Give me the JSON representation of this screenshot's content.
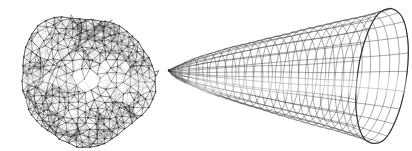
{
  "figure": {
    "background_color": "#ffffff",
    "canvas": {
      "width": 412,
      "height": 151
    },
    "left_mesh": {
      "label": "triangulated-blob-mesh",
      "cx": 86,
      "cy": 80,
      "rx": 64,
      "ry": 67,
      "rings": 9,
      "radial_exponent": 0.72,
      "cell_px": 8,
      "edge_max_px": 11.5,
      "jitter_px": 2.0,
      "seed_front": 7,
      "seed_back": 131,
      "front_color": "#3a3a3a",
      "back_color": "#a9a9a9",
      "dot_color": "#1f1f1f",
      "outline_color": "#4c4c4c",
      "crease_color": "#262626",
      "creases": [
        [
          [
            112,
            20
          ],
          [
            96,
            34
          ],
          [
            76,
            48
          ],
          [
            58,
            62
          ],
          [
            50,
            78
          ]
        ],
        [
          [
            50,
            78
          ],
          [
            45,
            98
          ],
          [
            52,
            118
          ]
        ],
        [
          [
            71,
            15
          ],
          [
            80,
            32
          ],
          [
            78,
            50
          ]
        ],
        [
          [
            28,
            90
          ],
          [
            36,
            112
          ],
          [
            54,
            131
          ]
        ]
      ]
    },
    "right_mesh": {
      "label": "horn-funnel-mesh",
      "apex_x": 169,
      "apex_y": 70.5,
      "length": 213,
      "radius": 64,
      "profile_exponent": 0.72,
      "flare": 0.06,
      "yaw_ratio": 0.37,
      "droop": 5.5,
      "droop_exponent": 0.4,
      "shear": 8,
      "meridians": 22,
      "rings": 26,
      "line_color": "#3d3d3d",
      "rim_color": "#1f1f1f",
      "apex_dot_color": "#222222"
    },
    "fade_bands": [
      {
        "x": 188,
        "y": 77,
        "w": 220,
        "h": 17,
        "opacity": 0.42
      },
      {
        "x": 22,
        "y": 74,
        "w": 130,
        "h": 12,
        "opacity": 0.3
      }
    ],
    "stray_mark": {
      "x": 156,
      "y": 73,
      "color": "#555555"
    }
  }
}
